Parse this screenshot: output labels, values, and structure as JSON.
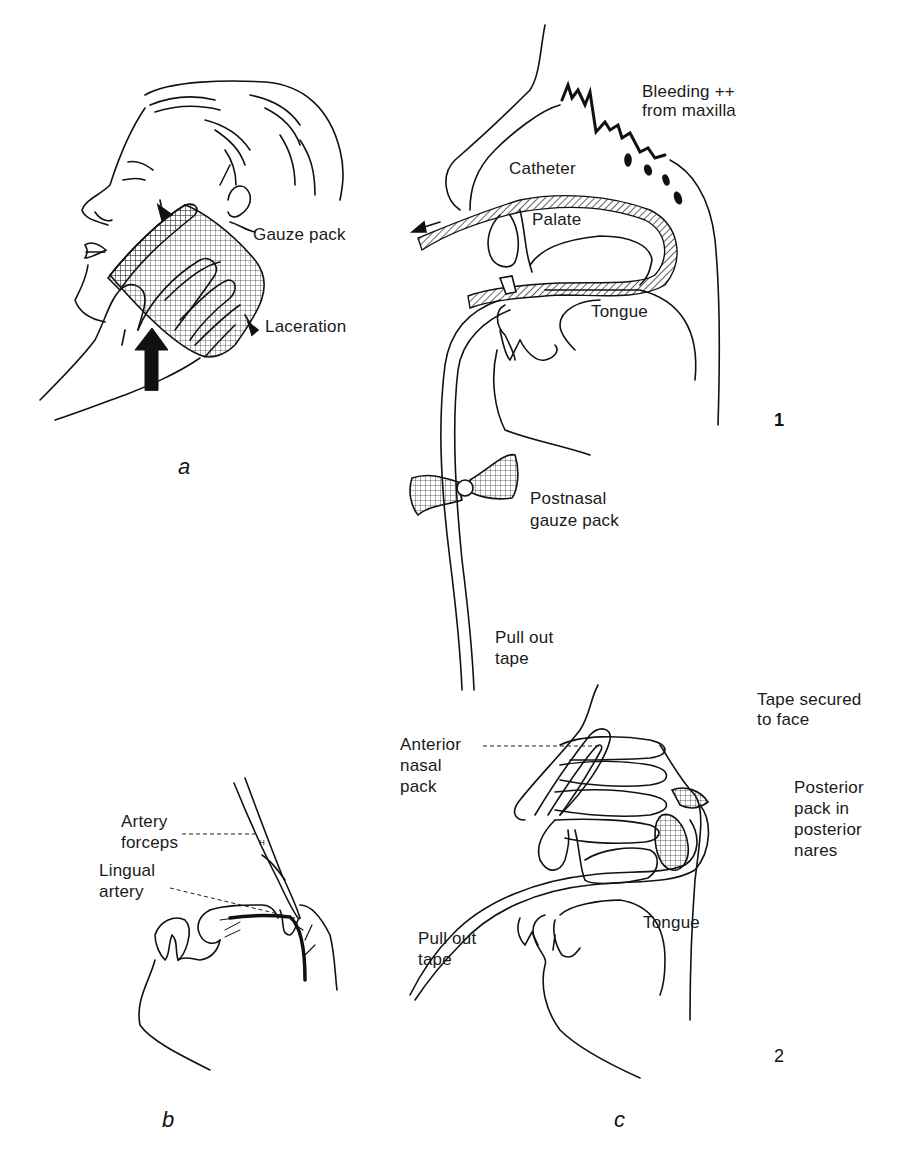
{
  "figure": {
    "panels": {
      "a": {
        "label": "a",
        "callouts": {
          "gauze_pack": "Gauze pack",
          "laceration": "Laceration"
        }
      },
      "b": {
        "label": "b",
        "callouts": {
          "artery_forceps_1": "Artery",
          "artery_forceps_2": "forceps",
          "lingual_artery_1": "Lingual",
          "lingual_artery_2": "artery"
        }
      },
      "c": {
        "label": "c",
        "step1": {
          "number": "1",
          "callouts": {
            "bleeding_1": "Bleeding ++",
            "bleeding_2": "from maxilla",
            "catheter": "Catheter",
            "palate": "Palate",
            "tongue": "Tongue",
            "postnasal_1": "Postnasal",
            "postnasal_2": "gauze pack",
            "pull_out_1": "Pull out",
            "pull_out_2": "tape"
          }
        },
        "step2": {
          "number": "2",
          "callouts": {
            "tape_secured_1": "Tape secured",
            "tape_secured_2": "to face",
            "anterior_1": "Anterior",
            "anterior_2": "nasal",
            "anterior_3": "pack",
            "posterior_1": "Posterior",
            "posterior_2": "pack in",
            "posterior_3": "posterior",
            "posterior_4": "nares",
            "tongue": "Tongue",
            "pull_out_1": "Pull out",
            "pull_out_2": "tape"
          }
        }
      }
    },
    "colors": {
      "ink": "#111111",
      "paper": "#ffffff"
    }
  }
}
